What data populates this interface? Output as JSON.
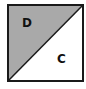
{
  "diagram": {
    "type": "square-split-by-diagonal",
    "regions": [
      {
        "label": "D",
        "fill": "#a9a9a9",
        "position": "upper-left triangle"
      },
      {
        "label": "C",
        "fill": "#ffffff",
        "position": "lower-right triangle"
      }
    ],
    "stroke_color": "#1a1a1a",
    "diagonal": "bottom-left to top-right"
  }
}
